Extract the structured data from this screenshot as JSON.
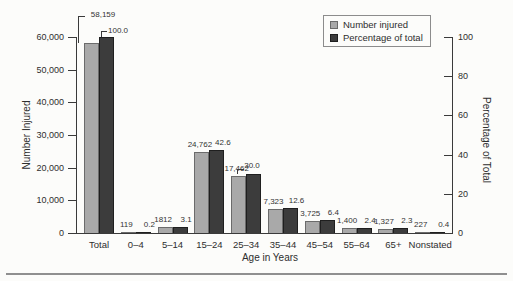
{
  "figure": {
    "background_color": "#fcfcfa",
    "bottom_rule_color": "#8f8f8f"
  },
  "chart_data": {
    "type": "bar",
    "title": "",
    "xlabel": "Age in Years",
    "ylabel_left": "Number Injured",
    "ylabel_right": "Percentage of Total",
    "grid": false,
    "legend_position": "top-right",
    "legend": [
      {
        "label": "Number injured",
        "color": "#a9a9a9",
        "border": "#6b6b6b"
      },
      {
        "label": "Percentage of total",
        "color": "#3c3c3c",
        "border": "#1f1f1f"
      }
    ],
    "categories": [
      "Total",
      "0–4",
      "5–14",
      "15–24",
      "25–34",
      "35–44",
      "45–54",
      "55–64",
      "65+",
      "Nonstated"
    ],
    "left_axis": {
      "max": 60000,
      "tick_values": [
        0,
        10000,
        20000,
        30000,
        40000,
        50000,
        60000
      ],
      "tick_labels": [
        "0",
        "10,000",
        "20,000",
        "30,000",
        "40,000",
        "50,000",
        "60,000"
      ]
    },
    "right_axis": {
      "max": 100,
      "tick_values": [
        0,
        20,
        40,
        60,
        80,
        100
      ],
      "tick_labels": [
        "0",
        "20",
        "40",
        "60",
        "80",
        "100"
      ]
    },
    "series": [
      {
        "name": "Number injured",
        "axis": "left",
        "color": "#a9a9a9",
        "values": [
          58159,
          119,
          1812,
          24762,
          17462,
          7323,
          3725,
          1400,
          1327,
          227
        ],
        "labels": [
          "58,159",
          "119",
          "1812",
          "24,762",
          "17,462",
          "7,323",
          "3,725",
          "1,400",
          "1,327",
          "227"
        ]
      },
      {
        "name": "Percentage of total",
        "axis": "right",
        "color": "#3c3c3c",
        "values": [
          100.0,
          0.2,
          3.1,
          42.6,
          30.0,
          12.6,
          6.4,
          2.4,
          2.3,
          0.4
        ],
        "labels": [
          "100.0",
          "0.2",
          "3.1",
          "42.6",
          "30.0",
          "12.6",
          "6.4",
          "2.4",
          "2.3",
          "0.4"
        ]
      }
    ]
  }
}
